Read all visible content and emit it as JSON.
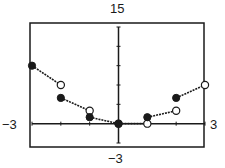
{
  "labels": {
    "ymax": "15",
    "ymin": "−3",
    "xmin": "−3",
    "xmax": "3"
  },
  "colors": {
    "ink": "#1a1a1a",
    "background": "#ffffff"
  },
  "chart_data": {
    "type": "scatter",
    "title": "",
    "xlabel": "",
    "ylabel": "",
    "xlim": [
      -3,
      3
    ],
    "ylim": [
      -3,
      15
    ],
    "x_tick_step": 1,
    "y_tick_step": 3,
    "grid": false,
    "function": "f(x) = x·⟦x⟧ (step-wise linear segments)",
    "segments": [
      {
        "x_start": -3,
        "y_start": 9,
        "start_closed": true,
        "x_end": -2,
        "y_end": 6,
        "end_closed": false
      },
      {
        "x_start": -2,
        "y_start": 4,
        "start_closed": true,
        "x_end": -1,
        "y_end": 2,
        "end_closed": false
      },
      {
        "x_start": -1,
        "y_start": 1,
        "start_closed": true,
        "x_end": 0,
        "y_end": 0,
        "end_closed": false
      },
      {
        "x_start": 0,
        "y_start": 0,
        "start_closed": true,
        "x_end": 1,
        "y_end": 0,
        "end_closed": false
      },
      {
        "x_start": 1,
        "y_start": 1,
        "start_closed": true,
        "x_end": 2,
        "y_end": 2,
        "end_closed": false
      },
      {
        "x_start": 2,
        "y_start": 4,
        "start_closed": true,
        "x_end": 3,
        "y_end": 6,
        "end_closed": false
      }
    ]
  }
}
